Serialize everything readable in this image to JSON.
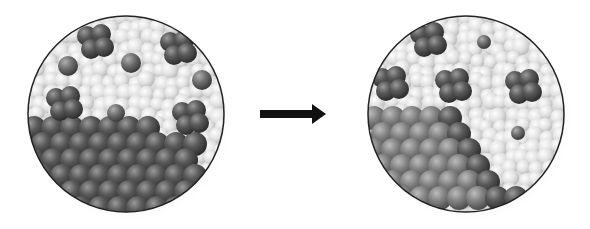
{
  "diagram": {
    "colors": {
      "background": "#ffffff",
      "liquid_light": "#e6e6e6",
      "liquid_mid": "#cfcfcf",
      "solid_dark": "#4a4a4a",
      "solid_mid": "#6e6e6e",
      "solid_light_right": "#8e8e8e",
      "cluster": "#555555",
      "single_particle": "#6a6a6a",
      "circle_outline": "#222222",
      "arrow": "#111111"
    },
    "panels": [
      {
        "id": "before",
        "cx": 126,
        "cy": 114,
        "r": 98,
        "clusters": [
          {
            "x": 95,
            "y": 42
          },
          {
            "x": 178,
            "y": 48
          },
          {
            "x": 64,
            "y": 104
          },
          {
            "x": 190,
            "y": 118
          }
        ],
        "singles": [
          {
            "x": 68,
            "y": 66,
            "r": 10
          },
          {
            "x": 131,
            "y": 63,
            "r": 10
          },
          {
            "x": 202,
            "y": 80,
            "r": 10
          },
          {
            "x": 116,
            "y": 113,
            "r": 9
          }
        ]
      },
      {
        "id": "after",
        "cx": 466,
        "cy": 114,
        "r": 98,
        "clusters": [
          {
            "x": 428,
            "y": 40
          },
          {
            "x": 390,
            "y": 84
          },
          {
            "x": 453,
            "y": 86
          },
          {
            "x": 523,
            "y": 87
          }
        ],
        "singles": [
          {
            "x": 484,
            "y": 42,
            "r": 7
          },
          {
            "x": 518,
            "y": 133,
            "r": 7
          }
        ]
      }
    ],
    "arrow": {
      "x1": 260,
      "x2": 326,
      "y": 114,
      "direction": "right"
    }
  }
}
